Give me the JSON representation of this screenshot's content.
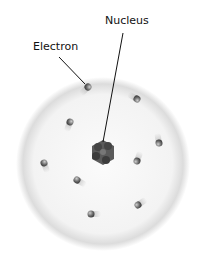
{
  "diagram": {
    "labels": {
      "nucleus": "Nucleus",
      "electron": "Electron"
    },
    "colors": {
      "cloud_edge": "#d6d6d6",
      "cloud_fill": "#f4f4f4",
      "nucleus": "#555555",
      "electron": "#6a6a6a",
      "leader_line": "#111111"
    },
    "electron_count": 9
  }
}
